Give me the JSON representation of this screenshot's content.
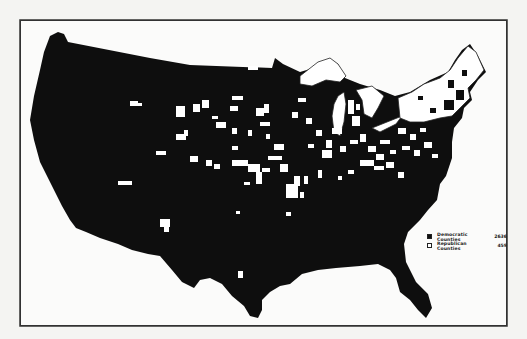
{
  "map": {
    "subject": "United States county-level election results map",
    "colors": {
      "democratic": "#0e0e0e",
      "republican": "#ffffff",
      "background": "#fbfbfa",
      "frame": "#333333"
    }
  },
  "legend": {
    "items": [
      {
        "label": "Democratic Counties",
        "count": "2636",
        "swatch": "black"
      },
      {
        "label": "Republican Counties",
        "count": "459",
        "swatch": "white"
      }
    ]
  }
}
